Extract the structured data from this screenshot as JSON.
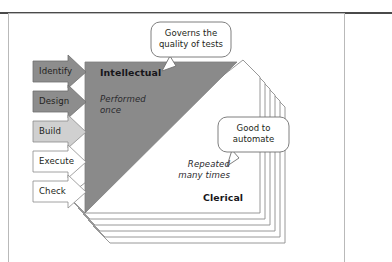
{
  "diagram": {
    "process_arrows": [
      {
        "label": "Identify",
        "fill": "#8d8d8d",
        "text_color": "#1b1b1b"
      },
      {
        "label": "Design",
        "fill": "#8d8d8d",
        "text_color": "#1b1b1b"
      },
      {
        "label": "Build",
        "fill": "#d0d0d0",
        "text_color": "#1b1b1b"
      },
      {
        "label": "Execute",
        "fill": "#ffffff",
        "text_color": "#1b1b1b"
      },
      {
        "label": "Check",
        "fill": "#ffffff",
        "text_color": "#1b1b1b"
      }
    ],
    "intellectual_region": {
      "title": "Intellectual",
      "subtitle_line1": "Performed",
      "subtitle_line2": "once",
      "fill": "#8a8a8a"
    },
    "clerical_region": {
      "title": "Clerical",
      "subtitle_line1": "Repeated",
      "subtitle_line2": "many times",
      "fill": "#ffffff",
      "stroke": "#8c8c8c",
      "sheet_count": 6
    },
    "callouts": [
      {
        "id": "callout-quality",
        "line1": "Governs the",
        "line2": "quality of tests"
      },
      {
        "id": "callout-automate",
        "line1": "Good to",
        "line2": "automate"
      }
    ],
    "colors": {
      "frame_rule": "#4a4a4a",
      "frame_border": "#b9b9b9",
      "outline": "#8c8c8c",
      "callout_border": "#707070",
      "background": "#ffffff"
    }
  }
}
